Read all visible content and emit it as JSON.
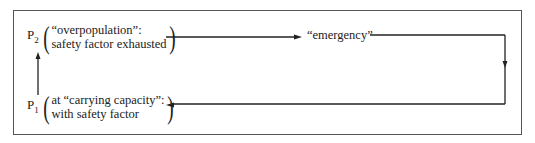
{
  "diagram": {
    "p2": {
      "label": "P",
      "subscript": "2",
      "line1": "“overpopulation”:",
      "line2": "safety factor exhausted"
    },
    "p1": {
      "label": "P",
      "subscript": "1",
      "line1": "at “carrying capacity”:",
      "line2": "with safety factor"
    },
    "emergency": "“emergency”",
    "edges": [
      {
        "from": "P1",
        "to": "P2",
        "direction": "up"
      },
      {
        "from": "P2",
        "to": "emergency",
        "direction": "right"
      },
      {
        "from": "emergency",
        "to": "P1",
        "direction": "loop down and left"
      }
    ],
    "colors": {
      "line": "#222222",
      "frame": "#555555"
    }
  }
}
